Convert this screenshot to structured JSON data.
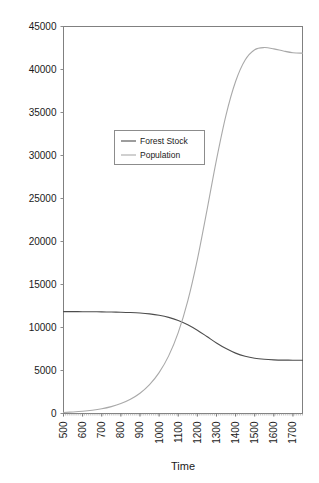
{
  "chart_data": {
    "type": "line",
    "title": "",
    "xlabel": "Time",
    "ylabel": "",
    "xlim": [
      500,
      1750
    ],
    "ylim": [
      0,
      45000
    ],
    "grid": false,
    "legend_position": "upper-left-inside",
    "x_tick_labels": [
      "500",
      "600",
      "700",
      "800",
      "900",
      "1000",
      "1100",
      "1200",
      "1300",
      "1400",
      "1500",
      "1600",
      "1700"
    ],
    "x_ticks": [
      500,
      600,
      700,
      800,
      900,
      1000,
      1100,
      1200,
      1300,
      1400,
      1500,
      1600,
      1700
    ],
    "y_tick_labels": [
      "0",
      "5000",
      "10000",
      "15000",
      "20000",
      "25000",
      "30000",
      "35000",
      "40000",
      "45000"
    ],
    "y_ticks": [
      0,
      5000,
      10000,
      15000,
      20000,
      25000,
      30000,
      35000,
      40000,
      45000
    ],
    "x": [
      500,
      550,
      600,
      650,
      700,
      750,
      800,
      850,
      900,
      950,
      1000,
      1050,
      1100,
      1150,
      1200,
      1250,
      1300,
      1350,
      1400,
      1450,
      1500,
      1550,
      1600,
      1650,
      1700,
      1750
    ],
    "series": [
      {
        "name": "Forest Stock",
        "color": "#4d4d4d",
        "values": [
          11850,
          11850,
          11840,
          11830,
          11820,
          11800,
          11780,
          11740,
          11680,
          11580,
          11420,
          11180,
          10820,
          10320,
          9680,
          8950,
          8200,
          7550,
          7020,
          6650,
          6420,
          6300,
          6240,
          6210,
          6200,
          6200
        ]
      },
      {
        "name": "Population",
        "color": "#a9a9a9",
        "values": [
          120,
          180,
          260,
          380,
          550,
          800,
          1150,
          1650,
          2350,
          3350,
          4750,
          6700,
          9400,
          13100,
          17900,
          23600,
          29500,
          34700,
          38600,
          41100,
          42300,
          42550,
          42400,
          42150,
          41950,
          41900
        ]
      }
    ]
  },
  "legend": {
    "items": [
      {
        "label": "Forest Stock",
        "color": "#4d4d4d"
      },
      {
        "label": "Population",
        "color": "#a9a9a9"
      }
    ]
  },
  "axes": {
    "x_axis_title": "Time"
  }
}
